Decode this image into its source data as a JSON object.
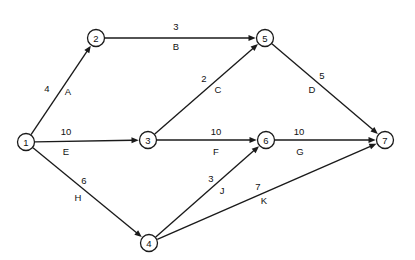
{
  "diagram": {
    "type": "directed-network-graph",
    "title": "",
    "colors": {
      "stroke": "#1a1a1a",
      "background": "#ffffff",
      "text": "#111111"
    },
    "nodes": [
      {
        "id": "1",
        "label": "1",
        "cx": 26,
        "cy": 142,
        "r": 8.5
      },
      {
        "id": "2",
        "label": "2",
        "cx": 96,
        "cy": 38,
        "r": 8.5
      },
      {
        "id": "3",
        "label": "3",
        "cx": 148,
        "cy": 140,
        "r": 8.5
      },
      {
        "id": "4",
        "label": "4",
        "cx": 149,
        "cy": 243,
        "r": 8.5
      },
      {
        "id": "5",
        "label": "5",
        "cx": 265,
        "cy": 38,
        "r": 8.5
      },
      {
        "id": "6",
        "label": "6",
        "cx": 266,
        "cy": 140,
        "r": 8.5
      },
      {
        "id": "7",
        "label": "7",
        "cx": 385,
        "cy": 140,
        "r": 8.5
      }
    ],
    "edges": [
      {
        "id": "A",
        "from": "1",
        "to": "2",
        "name": "A",
        "weight": "4",
        "weight_x": 47,
        "weight_y": 88,
        "name_x": 68,
        "name_y": 91
      },
      {
        "id": "B",
        "from": "2",
        "to": "5",
        "name": "B",
        "weight": "3",
        "weight_x": 176,
        "weight_y": 26,
        "name_x": 176,
        "name_y": 46
      },
      {
        "id": "C",
        "from": "3",
        "to": "5",
        "name": "C",
        "weight": "2",
        "weight_x": 204,
        "weight_y": 78,
        "name_x": 218,
        "name_y": 89
      },
      {
        "id": "D",
        "from": "5",
        "to": "7",
        "name": "D",
        "weight": "5",
        "weight_x": 322,
        "weight_y": 75,
        "name_x": 312,
        "name_y": 89
      },
      {
        "id": "E",
        "from": "1",
        "to": "3",
        "name": "E",
        "weight": "10",
        "weight_x": 66,
        "weight_y": 131,
        "name_x": 66,
        "name_y": 151
      },
      {
        "id": "F",
        "from": "3",
        "to": "6",
        "name": "F",
        "weight": "10",
        "weight_x": 216,
        "weight_y": 131,
        "name_x": 216,
        "name_y": 151
      },
      {
        "id": "G",
        "from": "6",
        "to": "7",
        "name": "G",
        "weight": "10",
        "weight_x": 299,
        "weight_y": 131,
        "name_x": 300,
        "name_y": 151
      },
      {
        "id": "H",
        "from": "1",
        "to": "4",
        "name": "H",
        "weight": "6",
        "weight_x": 84,
        "weight_y": 180,
        "name_x": 78,
        "name_y": 197
      },
      {
        "id": "J",
        "from": "4",
        "to": "6",
        "name": "J",
        "weight": "3",
        "weight_x": 211,
        "weight_y": 178,
        "name_x": 222,
        "name_y": 190
      },
      {
        "id": "K",
        "from": "4",
        "to": "7",
        "name": "K",
        "weight": "7",
        "weight_x": 258,
        "weight_y": 186,
        "name_x": 264,
        "name_y": 200
      }
    ]
  }
}
